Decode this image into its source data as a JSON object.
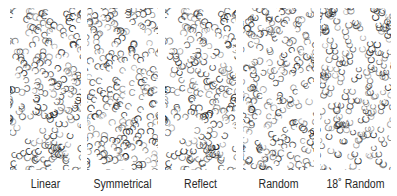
{
  "figure": {
    "panels": [
      {
        "id": "linear",
        "label": "Linear",
        "x": 10,
        "width": 71,
        "seed": 11,
        "rotation_mode": "linear"
      },
      {
        "id": "symmetrical",
        "label": "Symmetrical",
        "x": 87,
        "width": 71,
        "seed": 23,
        "rotation_mode": "symmetrical"
      },
      {
        "id": "reflect",
        "label": "Reflect",
        "x": 165,
        "width": 71,
        "seed": 11,
        "rotation_mode": "reflect"
      },
      {
        "id": "random",
        "label": "Random",
        "x": 243,
        "width": 71,
        "seed": 47,
        "rotation_mode": "random"
      },
      {
        "id": "random-18",
        "label": "18˚ Random",
        "x": 320,
        "width": 71,
        "seed": 59,
        "rotation_mode": "random18"
      }
    ],
    "glyph": "C",
    "glyph_color": "#1a1a1a",
    "glyph_count": 230
  }
}
